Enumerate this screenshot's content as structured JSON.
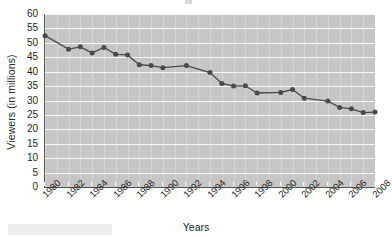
{
  "chart_data": {
    "type": "line",
    "title": "",
    "xlabel": "Years",
    "ylabel": "Viewers (in millions)",
    "ylim": [
      0,
      60
    ],
    "ytick_labels": [
      "60",
      "55",
      "50",
      "45",
      "40",
      "35",
      "30",
      "25",
      "20",
      "15",
      "10",
      "5",
      "0"
    ],
    "ytick_values": [
      60,
      55,
      50,
      45,
      40,
      35,
      30,
      25,
      20,
      15,
      10,
      5,
      0
    ],
    "xtick_labels": [
      "1980",
      "1982",
      "1984",
      "1986",
      "1988",
      "1990",
      "1992",
      "1994",
      "1996",
      "1998",
      "2000",
      "2002",
      "2004",
      "2006",
      "2008"
    ],
    "xtick_values": [
      1980,
      1982,
      1984,
      1986,
      1988,
      1990,
      1992,
      1994,
      1996,
      1998,
      2000,
      2002,
      2004,
      2006,
      2008
    ],
    "xlim": [
      1980,
      2008
    ],
    "grid": "horizontal-white-on-gray",
    "legend": "none",
    "marker": "circle",
    "line_color": "#4a4a4a",
    "marker_color": "#4a4a4a",
    "plot_background": "#c6c6c6",
    "x": [
      1980,
      1981,
      1982,
      1983,
      1984,
      1985,
      1986,
      1987,
      1988,
      1989,
      1990,
      1991,
      1992,
      1993,
      1994,
      1995,
      1996,
      1997,
      1998,
      1999,
      2000,
      2001,
      2002,
      2003,
      2004,
      2005,
      2006,
      2007,
      2008
    ],
    "values": [
      52.5,
      null,
      47.8,
      48.6,
      46.5,
      48.4,
      46.0,
      45.8,
      42.4,
      42.1,
      41.4,
      null,
      42.1,
      null,
      39.7,
      35.9,
      35.0,
      35.1,
      32.6,
      null,
      32.8,
      33.8,
      30.8,
      null,
      29.8,
      27.6,
      27.1,
      25.8,
      26.0
    ],
    "series": [
      {
        "name": "Viewers",
        "points": [
          {
            "year": 1980,
            "value": 52.5
          },
          {
            "year": 1982,
            "value": 47.8
          },
          {
            "year": 1983,
            "value": 48.6
          },
          {
            "year": 1984,
            "value": 46.5
          },
          {
            "year": 1985,
            "value": 48.4
          },
          {
            "year": 1986,
            "value": 46.0
          },
          {
            "year": 1987,
            "value": 45.8
          },
          {
            "year": 1988,
            "value": 42.4
          },
          {
            "year": 1989,
            "value": 42.1
          },
          {
            "year": 1990,
            "value": 41.4
          },
          {
            "year": 1992,
            "value": 42.1
          },
          {
            "year": 1994,
            "value": 39.7
          },
          {
            "year": 1995,
            "value": 35.9
          },
          {
            "year": 1996,
            "value": 35.0
          },
          {
            "year": 1997,
            "value": 35.1
          },
          {
            "year": 1998,
            "value": 32.6
          },
          {
            "year": 2000,
            "value": 32.8
          },
          {
            "year": 2001,
            "value": 33.8
          },
          {
            "year": 2002,
            "value": 30.8
          },
          {
            "year": 2004,
            "value": 29.8
          },
          {
            "year": 2005,
            "value": 27.6
          },
          {
            "year": 2006,
            "value": 27.1
          },
          {
            "year": 2007,
            "value": 25.8
          },
          {
            "year": 2008,
            "value": 26.0
          }
        ]
      }
    ]
  }
}
